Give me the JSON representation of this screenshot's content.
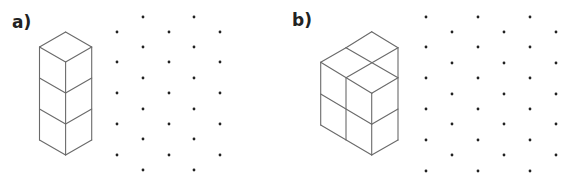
{
  "style": {
    "line_color": "#6a6a6a",
    "dot_color": "#222222",
    "background": "#ffffff",
    "dot_radius": 1.4
  },
  "parts": [
    {
      "id": "a",
      "label": "a)",
      "description": "Tower of 3 unit cubes stacked vertically (isometric view)",
      "cube_lines": [
        [
          65.6,
          32,
          91.7,
          47
        ],
        [
          65.6,
          32,
          39.5,
          47
        ],
        [
          39.5,
          47,
          65.6,
          62
        ],
        [
          65.6,
          62,
          91.7,
          47
        ],
        [
          39.5,
          47,
          39.5,
          140
        ],
        [
          65.6,
          62,
          65.6,
          155
        ],
        [
          91.7,
          47,
          91.7,
          140
        ],
        [
          39.5,
          78,
          65.6,
          93
        ],
        [
          65.6,
          93,
          91.7,
          78
        ],
        [
          39.5,
          109,
          65.6,
          124
        ],
        [
          65.6,
          124,
          91.7,
          109
        ],
        [
          39.5,
          140,
          65.6,
          155
        ],
        [
          65.6,
          155,
          91.7,
          140
        ]
      ],
      "dot_grid": {
        "columns": [
          {
            "x": 117,
            "ys": [
              32,
              62,
              93,
              124,
              155
            ]
          },
          {
            "x": 143,
            "ys": [
              17,
              47,
              78,
              109,
              139,
              170
            ]
          },
          {
            "x": 169,
            "ys": [
              32,
              62,
              93,
              124,
              155
            ]
          },
          {
            "x": 194,
            "ys": [
              17,
              47,
              78,
              109,
              139,
              170
            ]
          },
          {
            "x": 220,
            "ys": [
              32,
              62,
              93,
              124,
              155
            ]
          }
        ]
      }
    },
    {
      "id": "b",
      "label": "b)",
      "description": "Solid of unit cubes 2 high with stepped top (isometric view)",
      "cube_lines": [
        [
          371.7,
          31.7,
          398,
          47.7
        ],
        [
          371.7,
          31.7,
          346,
          47.7
        ],
        [
          346,
          47.7,
          320.7,
          62.3
        ],
        [
          346,
          47.7,
          398,
          77.7
        ],
        [
          398,
          47.7,
          346,
          77.7
        ],
        [
          320.7,
          62.3,
          371.7,
          93.3
        ],
        [
          371.7,
          93.3,
          398,
          77.7
        ],
        [
          398,
          47.7,
          398,
          140
        ],
        [
          320.7,
          62.3,
          320.7,
          125
        ],
        [
          346,
          77.7,
          346,
          140
        ],
        [
          371.7,
          93.3,
          371.7,
          155
        ],
        [
          320.7,
          94,
          371.7,
          124.3
        ],
        [
          371.7,
          124.3,
          398,
          109
        ],
        [
          320.7,
          125,
          371.7,
          155
        ],
        [
          371.7,
          155,
          398,
          140
        ]
      ],
      "dot_grid": {
        "columns": [
          {
            "x": 426,
            "ys": [
              17,
              47,
              78,
              109,
              140,
              171
            ]
          },
          {
            "x": 452,
            "ys": [
              32,
              63,
              94,
              124,
              155
            ]
          },
          {
            "x": 478,
            "ys": [
              17,
              47,
              78,
              109,
              140,
              171
            ]
          },
          {
            "x": 504,
            "ys": [
              32,
              63,
              94,
              124,
              155
            ]
          },
          {
            "x": 530,
            "ys": [
              17,
              47,
              78,
              109,
              140,
              171
            ]
          },
          {
            "x": 556,
            "ys": [
              32,
              63,
              94,
              124,
              155
            ]
          }
        ]
      }
    }
  ]
}
